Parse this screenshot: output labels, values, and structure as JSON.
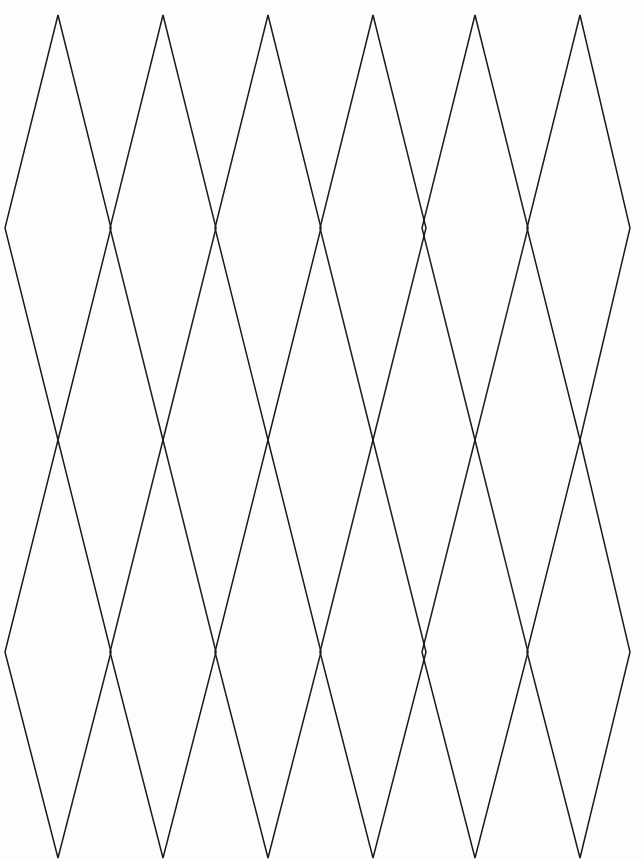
{
  "page": {
    "background_color": "#fdfdfc",
    "width": 641,
    "height": 861
  },
  "figure": {
    "name": "rhombus-tessellation",
    "description": "Line drawing of a tessellated lattice of tall narrow rhombi (diamonds) arranged in two stacked rows of six columns, drawn as thin black outlines on a white background.",
    "stroke_color": "#1a1a1a",
    "stroke_width": 1.5,
    "fill": "none",
    "rows": 2,
    "columns": 6,
    "shape": "rhombus",
    "geometry": {
      "apex_x_positions": [
        58,
        163,
        268,
        373,
        475,
        580
      ],
      "column_spacing": 104.4,
      "half_width": 53,
      "row_top_y": [
        15,
        440
      ],
      "row_middle_y": [
        228,
        652
      ],
      "row_bottom_y": [
        440,
        858
      ],
      "left_edge_vertex_x": 4,
      "right_edge_vertex_x": 630
    }
  }
}
